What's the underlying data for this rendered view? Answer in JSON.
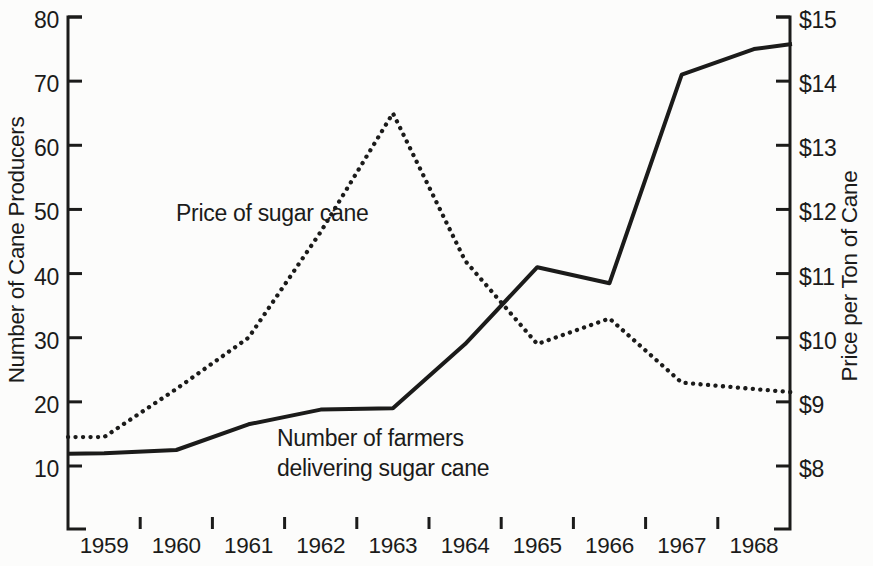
{
  "chart_data": {
    "type": "line",
    "title": "",
    "x_years": [
      1959,
      1960,
      1961,
      1962,
      1963,
      1964,
      1965,
      1966,
      1967,
      1968
    ],
    "x_tick_labels": [
      "1959",
      "1960",
      "1961",
      "1962",
      "1963",
      "1964",
      "1965",
      "1966",
      "1967",
      "1968"
    ],
    "left_axis": {
      "label": "Number of Cane Producers",
      "tick_values": [
        80,
        70,
        60,
        50,
        40,
        30,
        20,
        10
      ],
      "tick_labels": [
        "80",
        "70",
        "60",
        "50",
        "40",
        "30",
        "20",
        "10"
      ],
      "range": [
        10,
        80
      ]
    },
    "right_axis": {
      "label": "Price per Ton of Cane",
      "tick_values": [
        15,
        14,
        13,
        12,
        11,
        10,
        9,
        8
      ],
      "tick_labels": [
        "$15",
        "$14",
        "$13",
        "$12",
        "$11",
        "$10",
        "$9",
        "$8"
      ],
      "range": [
        8,
        15
      ]
    },
    "series": [
      {
        "name": "Number of farmers delivering sugar cane",
        "axis": "left",
        "line_style": "solid",
        "values": [
          12,
          12.5,
          16.5,
          18.8,
          19,
          29,
          41,
          38.5,
          71,
          75
        ],
        "value_at_left_edge": 11.9,
        "value_at_right_edge": 75.8
      },
      {
        "name": "Price of sugar cane",
        "axis": "right",
        "line_style": "dotted",
        "values": [
          8.45,
          9.2,
          10,
          11.65,
          13.5,
          11.2,
          9.9,
          10.3,
          9.3,
          9.2
        ],
        "value_at_left_edge": 8.45,
        "value_at_right_edge": 9.15
      }
    ],
    "annotations": [
      {
        "id": "price-line-label",
        "lines": [
          "Price of sugar cane"
        ],
        "x": 176,
        "y": 221
      },
      {
        "id": "farmers-line-label",
        "lines": [
          "Number of farmers",
          "delivering sugar cane"
        ],
        "x": 277,
        "y": 446
      }
    ],
    "grid": "off",
    "legend": "inline-annotations"
  },
  "colors": {
    "ink": "#1b1b1a",
    "background": "#fcfcfb"
  }
}
